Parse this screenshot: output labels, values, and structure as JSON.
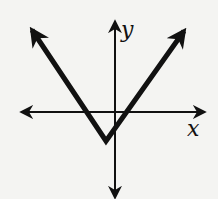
{
  "graph": {
    "type": "absolute-value-function",
    "x_label": "x",
    "y_label": "y",
    "vertex_px": [
      106,
      141
    ],
    "origin_px": [
      115,
      112
    ],
    "left_ray_end_px": [
      27,
      23
    ],
    "right_ray_end_px": [
      189,
      24
    ],
    "colors": {
      "ink": "#111111",
      "background": "#f4f4f2"
    }
  }
}
